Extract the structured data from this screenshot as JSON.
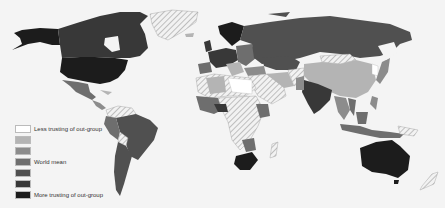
{
  "map": {
    "title": "",
    "type": "choropleth world map",
    "no_data_pattern": "diagonal hatch"
  },
  "legend": {
    "items": [
      {
        "label": "Less trusting of out-group",
        "color": "#ffffff"
      },
      {
        "label": "",
        "color": "#b4b4b4"
      },
      {
        "label": "",
        "color": "#8c8c8c"
      },
      {
        "label": "World mean",
        "color": "#6e6e6e"
      },
      {
        "label": "",
        "color": "#505050"
      },
      {
        "label": "",
        "color": "#383838"
      },
      {
        "label": "More trusting of out-group",
        "color": "#1c1c1c"
      }
    ]
  },
  "colors": {
    "background": "#f4f4f4",
    "hatch": "#999999",
    "l0": "#ffffff",
    "l1": "#b4b4b4",
    "l2": "#8c8c8c",
    "l3": "#6e6e6e",
    "l4": "#505050",
    "l5": "#383838",
    "l6": "#1c1c1c"
  }
}
